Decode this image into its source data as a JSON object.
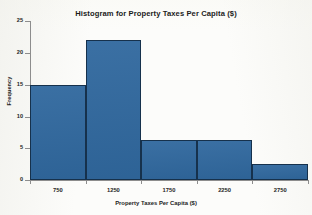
{
  "chart_data": {
    "type": "bar",
    "title": "Histogram for Property Taxes Per Capita ($)",
    "xlabel": "Property Taxes Per Capita ($)",
    "ylabel": "Frequency",
    "categories": [
      "750",
      "1250",
      "1750",
      "2250",
      "2750"
    ],
    "values": [
      15,
      22,
      6.3,
      6.3,
      2.5
    ],
    "bin_edges": [
      500,
      1000,
      1500,
      2000,
      2500,
      3000
    ],
    "ylim": [
      0,
      25
    ],
    "yticks": [
      0,
      5,
      10,
      15,
      20,
      25
    ],
    "ytick_labels": [
      "0",
      "5",
      "10",
      "15",
      "20",
      "25"
    ],
    "xtick_labels": [
      "750",
      "1250",
      "1750",
      "2250",
      "2750"
    ],
    "grid": false,
    "legend": false,
    "bar_color": "#30689e",
    "bar_edge_color": "#16314c",
    "axis_color": "#8d8d8d",
    "background_color": "#fcfcfa"
  }
}
